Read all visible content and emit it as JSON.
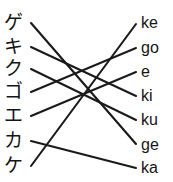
{
  "exercise": {
    "type": "matching-lines",
    "width": 173,
    "height": 182,
    "background_color": "#ffffff",
    "line_color": "#1a1a1a",
    "text_color": "#151515"
  },
  "left_column": {
    "name": "katakana-column",
    "items": [
      {
        "label": "ゲ",
        "y": 10
      },
      {
        "label": "キ",
        "y": 34
      },
      {
        "label": "ク",
        "y": 56
      },
      {
        "label": "ゴ",
        "y": 79
      },
      {
        "label": "エ",
        "y": 103
      },
      {
        "label": "カ",
        "y": 128
      },
      {
        "label": "ケ",
        "y": 153
      }
    ]
  },
  "right_column": {
    "name": "romaji-column",
    "items": [
      {
        "label": "ke",
        "y": 11
      },
      {
        "label": "go",
        "y": 36
      },
      {
        "label": "e",
        "y": 60
      },
      {
        "label": "ki",
        "y": 84
      },
      {
        "label": "ku",
        "y": 108
      },
      {
        "label": "ge",
        "y": 133
      },
      {
        "label": "ka",
        "y": 156
      }
    ]
  },
  "connections": [
    {
      "from": "ゲ",
      "to": "ge",
      "x1": 31,
      "y1": 23,
      "x2": 136,
      "y2": 144
    },
    {
      "from": "キ",
      "to": "ki",
      "x1": 31,
      "y1": 47,
      "x2": 136,
      "y2": 96
    },
    {
      "from": "ク",
      "to": "ku",
      "x1": 31,
      "y1": 69,
      "x2": 136,
      "y2": 120
    },
    {
      "from": "ゴ",
      "to": "go",
      "x1": 31,
      "y1": 92,
      "x2": 136,
      "y2": 48
    },
    {
      "from": "エ",
      "to": "e",
      "x1": 31,
      "y1": 116,
      "x2": 136,
      "y2": 72
    },
    {
      "from": "カ",
      "to": "ka",
      "x1": 31,
      "y1": 141,
      "x2": 136,
      "y2": 168
    },
    {
      "from": "ケ",
      "to": "ke",
      "x1": 31,
      "y1": 166,
      "x2": 136,
      "y2": 24
    }
  ]
}
